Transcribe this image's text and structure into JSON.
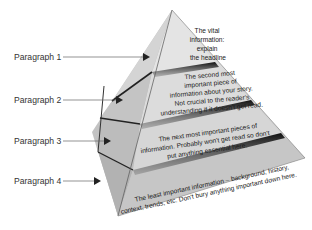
{
  "diagram": {
    "labels": [
      {
        "text": "Paragraph 1",
        "y": 52
      },
      {
        "text": "Paragraph 2",
        "y": 95
      },
      {
        "text": "Paragraph 3",
        "y": 136
      },
      {
        "text": "Paragraph 4",
        "y": 176
      }
    ],
    "tiers": [
      {
        "lines": [
          "The vital",
          "information:",
          "explain",
          "the headline"
        ]
      },
      {
        "lines": [
          "The second most",
          "important piece of",
          "information about your story.",
          "Not crucial to the reader's",
          "understanding if it doesn't get read."
        ]
      },
      {
        "lines": [
          "The next most important pieces of",
          "information. Probably won't get read so don't",
          "put anything essential here."
        ]
      },
      {
        "lines": [
          "The least important information – background, history,",
          "context, trends, etc. Don't bury anything important down here."
        ]
      }
    ],
    "colors": {
      "face_light": "#e2e2e2",
      "face_mid": "#c8c8c8",
      "side_dark": "#b4b4b4",
      "shadow": "#1e1e1e",
      "leader": "#555555"
    }
  }
}
